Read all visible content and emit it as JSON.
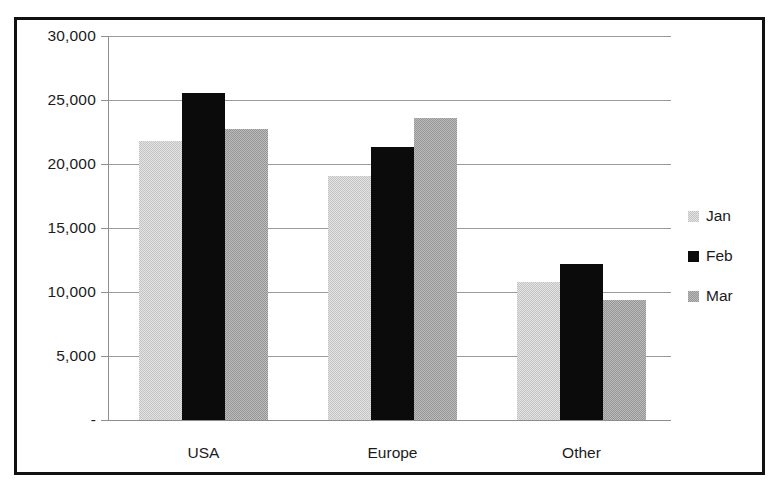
{
  "chart_data": {
    "type": "bar",
    "title": "",
    "xlabel": "",
    "ylabel": "",
    "categories": [
      "USA",
      "Europe",
      "Other"
    ],
    "series": [
      {
        "name": "Jan",
        "color": "#c3c3c3",
        "values": [
          21800,
          19100,
          10800
        ]
      },
      {
        "name": "Feb",
        "color": "#0b0b0b",
        "values": [
          25550,
          21300,
          12200
        ]
      },
      {
        "name": "Mar",
        "color": "#969696",
        "values": [
          22700,
          23600,
          9400
        ]
      }
    ],
    "ylim": [
      0,
      30000
    ],
    "ytick_values": [
      30000,
      25000,
      20000,
      15000,
      10000,
      5000,
      0
    ],
    "ytick_labels": [
      "30,000",
      "25,000",
      "20,000",
      "15,000",
      "10,000",
      "5,000",
      "-"
    ],
    "grid": true,
    "legend_position": "right",
    "annotations": []
  },
  "legend": {
    "entries": [
      {
        "label": "Jan"
      },
      {
        "label": "Feb"
      },
      {
        "label": "Mar"
      }
    ]
  }
}
